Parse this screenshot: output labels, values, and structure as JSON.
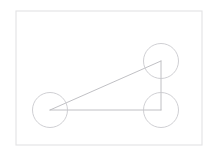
{
  "canvas": {
    "width": 216,
    "height": 155,
    "background_color": "#ffffff"
  },
  "frame": {
    "label": "paper-border",
    "x": 16,
    "y": 11,
    "width": 186,
    "height": 134,
    "stroke_color": "#e2e2e4",
    "stroke_width": 1.1,
    "fill_color": "#ffffff"
  },
  "chart_data": {
    "type": "scatter",
    "title": "",
    "xlabel": "",
    "ylabel": "",
    "grid": false,
    "legend": "none",
    "xlim": [
      16,
      202
    ],
    "ylim": [
      11,
      145
    ],
    "vertices": [
      {
        "name": "left-vertex",
        "x": 50,
        "y": 110
      },
      {
        "name": "apex-vertex",
        "x": 161,
        "y": 61
      },
      {
        "name": "right-angle-vertex",
        "x": 161,
        "y": 110
      }
    ],
    "edges": [
      {
        "name": "hypotenuse",
        "from": "left-vertex",
        "to": "apex-vertex"
      },
      {
        "name": "vertical-leg",
        "from": "apex-vertex",
        "to": "right-angle-vertex"
      },
      {
        "name": "horizontal-leg",
        "from": "right-angle-vertex",
        "to": "left-vertex"
      }
    ],
    "circles": [
      {
        "name": "circle-left",
        "cx": 50,
        "cy": 110,
        "r": 17.5
      },
      {
        "name": "circle-top-right",
        "cx": 161,
        "cy": 61,
        "r": 17.5
      },
      {
        "name": "circle-bottom-right",
        "cx": 161,
        "cy": 110,
        "r": 17.5
      }
    ],
    "series": [
      {
        "name": "vertex-circles",
        "x": [
          50,
          161,
          161
        ],
        "y": [
          110,
          61,
          110
        ],
        "r": [
          17.5,
          17.5,
          17.5
        ]
      }
    ]
  },
  "style": {
    "line_color": "#b9b9bd",
    "line_width": 0.9,
    "circle_color": "#c9c9ce",
    "circle_width": 0.9
  }
}
